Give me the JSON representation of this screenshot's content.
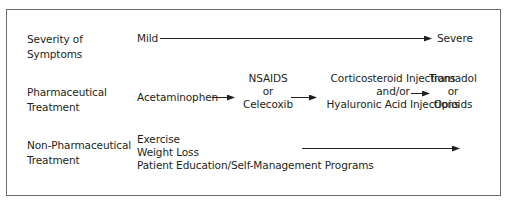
{
  "rows": [
    {
      "label_lines": [
        "Severity of",
        "Symptoms"
      ],
      "start": "Mild",
      "end": "Severe"
    },
    {
      "label_lines": [
        "Pharmaceutical",
        "Treatment"
      ],
      "steps": [
        {
          "lines": [
            "Acetaminophen"
          ]
        },
        {
          "lines": [
            "NSAIDS",
            "or",
            "Celecoxib"
          ]
        },
        {
          "lines": [
            "Corticosteroid Injections",
            "and/or",
            "Hyaluronic Acid Injections"
          ]
        },
        {
          "lines": [
            "Tramadol",
            "or",
            "Opioids"
          ]
        }
      ]
    },
    {
      "label_lines": [
        "Non-Pharmaceutical",
        "Treatment"
      ],
      "items": [
        "Exercise",
        "Weight Loss",
        "Patient Education/Self-Management Programs"
      ]
    }
  ],
  "colors": {
    "text": "#231f20",
    "border": "#6d6d6d",
    "arrow": "#231f20"
  }
}
